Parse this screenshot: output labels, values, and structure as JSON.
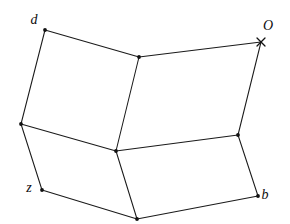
{
  "figure": {
    "background_color": "#ffffff",
    "line_color": "#1a1a1a",
    "label_color": "#0d0d0d",
    "width": 290,
    "height": 224
  },
  "vertices": [
    {
      "id": "d",
      "label": "d",
      "x": 45,
      "y": 30,
      "marker": "dot",
      "label_x": 34,
      "label_y": 21,
      "labeled": true
    },
    {
      "id": "top-mid",
      "label": "",
      "x": 139,
      "y": 57,
      "marker": "dot",
      "label_x": 0,
      "label_y": 0,
      "labeled": false
    },
    {
      "id": "O",
      "label": "O",
      "x": 261,
      "y": 42,
      "marker": "cross",
      "label_x": 268,
      "label_y": 27,
      "labeled": true
    },
    {
      "id": "left-mid",
      "label": "",
      "x": 21,
      "y": 124,
      "marker": "dot",
      "label_x": 0,
      "label_y": 0,
      "labeled": false
    },
    {
      "id": "center",
      "label": "",
      "x": 116,
      "y": 151,
      "marker": "dot",
      "label_x": 0,
      "label_y": 0,
      "labeled": false
    },
    {
      "id": "right-mid",
      "label": "",
      "x": 238,
      "y": 135,
      "marker": "dot",
      "label_x": 0,
      "label_y": 0,
      "labeled": false
    },
    {
      "id": "z",
      "label": "z",
      "x": 42,
      "y": 190,
      "marker": "dot",
      "label_x": 29,
      "label_y": 189,
      "labeled": true
    },
    {
      "id": "bottom-mid",
      "label": "",
      "x": 137,
      "y": 219,
      "marker": "dot",
      "label_x": 0,
      "label_y": 0,
      "labeled": false
    },
    {
      "id": "b",
      "label": "b",
      "x": 258,
      "y": 196,
      "marker": "dot",
      "label_x": 265,
      "label_y": 196,
      "labeled": true
    }
  ],
  "edges": [
    {
      "from": "d",
      "to": "top-mid"
    },
    {
      "from": "top-mid",
      "to": "O"
    },
    {
      "from": "d",
      "to": "left-mid"
    },
    {
      "from": "top-mid",
      "to": "center"
    },
    {
      "from": "O",
      "to": "right-mid"
    },
    {
      "from": "left-mid",
      "to": "center"
    },
    {
      "from": "center",
      "to": "right-mid"
    },
    {
      "from": "left-mid",
      "to": "z"
    },
    {
      "from": "center",
      "to": "bottom-mid"
    },
    {
      "from": "right-mid",
      "to": "b"
    },
    {
      "from": "z",
      "to": "bottom-mid"
    },
    {
      "from": "bottom-mid",
      "to": "b"
    }
  ],
  "faces": [
    {
      "id": "face-upper-left",
      "vertices": [
        "d",
        "top-mid",
        "center",
        "left-mid"
      ]
    },
    {
      "id": "face-upper-right",
      "vertices": [
        "top-mid",
        "O",
        "right-mid",
        "center"
      ]
    },
    {
      "id": "face-lower-left",
      "vertices": [
        "left-mid",
        "center",
        "bottom-mid",
        "z"
      ]
    },
    {
      "id": "face-lower-right",
      "vertices": [
        "center",
        "right-mid",
        "b",
        "bottom-mid"
      ]
    }
  ],
  "labels": {
    "d": "d",
    "O": "O",
    "z": "z",
    "b": "b"
  }
}
